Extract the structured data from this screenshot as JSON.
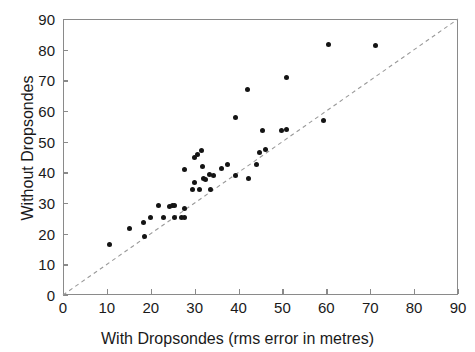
{
  "chart_data": {
    "type": "scatter",
    "title": "",
    "xlabel": "With Dropsondes (rms error in metres)",
    "ylabel": "Without Dropsondes",
    "xlim": [
      0,
      90
    ],
    "ylim": [
      0,
      90
    ],
    "xticks": [
      0,
      10,
      20,
      30,
      40,
      50,
      60,
      70,
      80,
      90
    ],
    "yticks": [
      0,
      10,
      20,
      30,
      40,
      50,
      60,
      70,
      80,
      90
    ],
    "grid": false,
    "legend": null,
    "marker_color": "#141414",
    "reference_line": {
      "style": "dashed",
      "color": "#9a9a9a",
      "from": [
        0,
        0
      ],
      "to": [
        90,
        90
      ],
      "label": "one-to-one line"
    },
    "points": [
      [
        10.7,
        16.6
      ],
      [
        15.2,
        21.8
      ],
      [
        18.6,
        19.0
      ],
      [
        18.3,
        23.6
      ],
      [
        19.9,
        25.3
      ],
      [
        21.8,
        29.1
      ],
      [
        22.8,
        25.2
      ],
      [
        24.3,
        29.0
      ],
      [
        25.0,
        29.1
      ],
      [
        25.3,
        29.1
      ],
      [
        25.4,
        25.3
      ],
      [
        26.9,
        25.4
      ],
      [
        27.6,
        25.4
      ],
      [
        27.7,
        28.3
      ],
      [
        27.7,
        41.0
      ],
      [
        29.6,
        34.4
      ],
      [
        29.9,
        36.7
      ],
      [
        30.6,
        45.8
      ],
      [
        30.0,
        45.0
      ],
      [
        31.6,
        47.0
      ],
      [
        31.0,
        34.4
      ],
      [
        31.8,
        42.0
      ],
      [
        32.0,
        38.0
      ],
      [
        32.5,
        37.6
      ],
      [
        33.4,
        39.4
      ],
      [
        33.6,
        34.5
      ],
      [
        34.3,
        39.0
      ],
      [
        36.1,
        41.2
      ],
      [
        37.5,
        42.4
      ],
      [
        39.3,
        39.0
      ],
      [
        39.4,
        57.8
      ],
      [
        42.0,
        67.0
      ],
      [
        42.2,
        38.0
      ],
      [
        44.2,
        42.6
      ],
      [
        44.7,
        46.6
      ],
      [
        45.5,
        53.5
      ],
      [
        46.2,
        47.4
      ],
      [
        49.8,
        53.5
      ],
      [
        51.0,
        54.0
      ],
      [
        51.0,
        71.0
      ],
      [
        59.3,
        57.0
      ],
      [
        60.5,
        81.8
      ],
      [
        71.1,
        81.3
      ]
    ]
  },
  "axes": {
    "x_tick_labels": [
      "0",
      "10",
      "20",
      "30",
      "40",
      "50",
      "60",
      "70",
      "80",
      "90"
    ],
    "y_tick_labels": [
      "0",
      "10",
      "20",
      "30",
      "40",
      "50",
      "60",
      "70",
      "80",
      "90"
    ],
    "x_axis_label": "With Dropsondes (rms error in metres)",
    "y_axis_label": "Without Dropsondes"
  }
}
